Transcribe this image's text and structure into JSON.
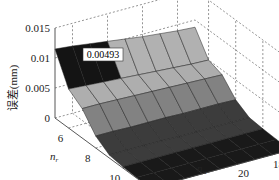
{
  "chart_data": {
    "type": "surface3d",
    "title": "",
    "zlabel": "误差(mm)",
    "xlabel": "n_r",
    "xlabel_main": "n",
    "xlabel_sub": "r",
    "ylabel": "n_w",
    "ylabel_main": "n",
    "ylabel_sub": "w",
    "x_ticks": [
      "6",
      "8",
      "10",
      "12"
    ],
    "y_ticks": [
      "24",
      "22",
      "20",
      "18"
    ],
    "z_ticks": [
      "0",
      "0.005",
      "0.01",
      "0.015"
    ],
    "xlim": [
      5,
      12
    ],
    "ylim": [
      17,
      25
    ],
    "zlim": [
      0,
      0.015
    ],
    "x": [
      5,
      6,
      7,
      8,
      9,
      10,
      11,
      12
    ],
    "y": [
      25,
      24,
      23,
      22,
      21,
      20,
      19,
      18,
      17
    ],
    "z_description": "error decreases as n_r increases; near-zero for n_r >= 8",
    "z": [
      [
        0.0115,
        0.0112,
        0.0108,
        0.0104,
        0.01,
        0.0096,
        0.0093,
        0.009,
        0.0088
      ],
      [
        0.0065,
        0.0063,
        0.0061,
        0.0059,
        0.0057,
        0.0055,
        0.0053,
        0.0051,
        0.005
      ],
      [
        0.0049,
        0.0049,
        0.0048,
        0.0047,
        0.0046,
        0.0045,
        0.0044,
        0.0043,
        0.0042
      ],
      [
        0.002,
        0.002,
        0.0019,
        0.0019,
        0.0019,
        0.0018,
        0.0018,
        0.0018,
        0.0017
      ],
      [
        0.0005,
        0.0005,
        0.0005,
        0.0005,
        0.0004,
        0.0004,
        0.0004,
        0.0004,
        0.0004
      ],
      [
        0.0002,
        0.0002,
        0.0002,
        0.0002,
        0.0002,
        0.0002,
        0.0002,
        0.0002,
        0.0002
      ],
      [
        0.0001,
        0.0001,
        0.0001,
        0.0001,
        0.0001,
        0.0001,
        0.0001,
        0.0001,
        0.0001
      ],
      [
        0.0,
        0.0,
        0.0,
        0.0,
        0.0,
        0.0,
        0.0,
        0.0,
        0.0
      ]
    ],
    "annotations": [
      {
        "text": "0.00493",
        "x": 7,
        "y": 24,
        "z": 0.00493
      }
    ],
    "grid": true,
    "colormap": "gray"
  }
}
